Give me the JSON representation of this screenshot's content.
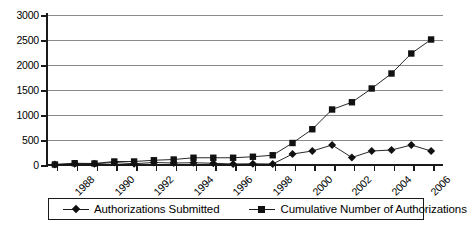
{
  "chart_data": {
    "type": "line",
    "title": "",
    "xlabel": "",
    "ylabel": "",
    "ylim": [
      0,
      3000
    ],
    "yticks": [
      0,
      500,
      1000,
      1500,
      2000,
      2500,
      3000
    ],
    "ytick_labels": [
      "0",
      "500",
      "1000",
      "1500",
      "2000",
      "2500",
      "3000"
    ],
    "grid": true,
    "legend_position": "below",
    "x": [
      1988,
      1989,
      1990,
      1991,
      1992,
      1993,
      1994,
      1995,
      1996,
      1997,
      1998,
      1999,
      2000,
      2001,
      2002,
      2003,
      2004,
      2005,
      2006,
      2007
    ],
    "xtick_labels": [
      "1988",
      "",
      "1990",
      "",
      "1992",
      "",
      "1994",
      "",
      "1996",
      "",
      "1998",
      "",
      "2000",
      "",
      "2002",
      "",
      "2004",
      "",
      "2006",
      ""
    ],
    "xtick_labels_shown": [
      "1988",
      "1990",
      "1992",
      "1994",
      "1996",
      "1998",
      "2000",
      "2002",
      "2004",
      "2006"
    ],
    "series": [
      {
        "name": "Authorizations Submitted",
        "marker": "diamond",
        "color": "#111111",
        "values": [
          10,
          25,
          25,
          50,
          25,
          50,
          40,
          45,
          35,
          20,
          25,
          20,
          220,
          280,
          400,
          150,
          280,
          300,
          400,
          280
        ]
      },
      {
        "name": "Cumulative Number of Authorizations",
        "marker": "square",
        "color": "#111111",
        "values": [
          10,
          35,
          30,
          70,
          70,
          95,
          110,
          145,
          145,
          145,
          165,
          195,
          440,
          715,
          1110,
          1255,
          1530,
          1830,
          2230,
          2510
        ]
      }
    ]
  },
  "legend": {
    "entries": [
      {
        "label": "Authorizations Submitted",
        "marker": "diamond"
      },
      {
        "label": "Cumulative Number of Authorizations",
        "marker": "square"
      }
    ]
  }
}
